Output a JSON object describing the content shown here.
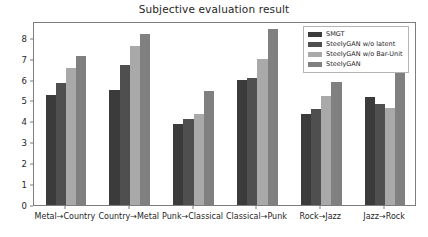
{
  "chart_data": {
    "type": "bar",
    "title": "Subjective evaluation result",
    "xlabel": "",
    "ylabel": "",
    "ylim": [
      0,
      8.8
    ],
    "yticks": [
      0,
      1,
      2,
      3,
      4,
      5,
      6,
      7,
      8
    ],
    "ytick_labels": [
      "0",
      "1",
      "2",
      "3",
      "4",
      "5",
      "6",
      "7",
      "8"
    ],
    "grid": false,
    "legend_position": "upper right",
    "categories": [
      "Metal→Country",
      "Country→Metal",
      "Punk→Classical",
      "Classical→Punk",
      "Rock→Jazz",
      "Jazz→Rock"
    ],
    "series": [
      {
        "name": "SMGT",
        "color": "#3b3b3b",
        "values": [
          5.25,
          5.52,
          3.88,
          5.96,
          4.36,
          5.18
        ]
      },
      {
        "name": "SteelyGAN w/o latent",
        "color": "#4f4f4f",
        "values": [
          5.82,
          6.68,
          4.1,
          6.07,
          4.57,
          4.82
        ]
      },
      {
        "name": "SteelyGAN w/o Bar-Unit",
        "color": "#a9a9a9",
        "values": [
          6.56,
          7.6,
          4.37,
          6.97,
          5.22,
          4.66
        ]
      },
      {
        "name": "SteelyGAN",
        "color": "#808080",
        "values": [
          7.15,
          8.19,
          5.47,
          8.42,
          5.89,
          6.49
        ]
      }
    ]
  },
  "figure": {
    "background_color": "#ffffff",
    "axes_edge_color": "#7d7d7d",
    "text_color": "#262626"
  }
}
